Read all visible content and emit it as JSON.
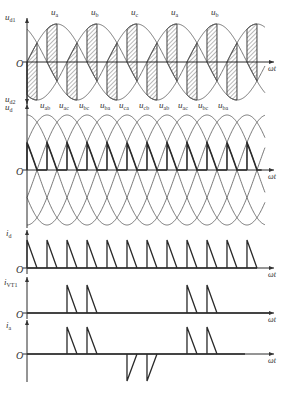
{
  "figure": {
    "origin_x": 27,
    "px_per_degree": 0.3333,
    "end_x": 265,
    "axis_end_x": 274,
    "ink_color": "#2a2a2a",
    "curve_color": "#555555"
  },
  "panels": {
    "phase": {
      "zero_y": 62,
      "amplitude_px": 38,
      "y_axis_top": 18,
      "y_axis_bottom": 104,
      "ylabel_top": "u",
      "ylabel_top_sub": "d1",
      "ylabel_bottom": "u",
      "ylabel_bottom_sub": "d2",
      "origin_label": "O",
      "xlabel": "ωt",
      "phase_labels": [
        {
          "base": "u",
          "sub": "a",
          "x": 51
        },
        {
          "base": "u",
          "sub": "b",
          "x": 91
        },
        {
          "base": "u",
          "sub": "c",
          "x": 131
        },
        {
          "base": "u",
          "sub": "a",
          "x": 171
        },
        {
          "base": "u",
          "sub": "b",
          "x": 211
        }
      ],
      "firing_deg_top": [
        0,
        120,
        240,
        360,
        480,
        600
      ],
      "firing_deg_bottom": [
        60,
        180,
        300,
        420,
        540,
        660
      ]
    },
    "line": {
      "zero_y": 170,
      "amplitude_px": 55,
      "y_axis_top": 104,
      "ylabel": "u",
      "ylabel_sub": "d",
      "origin_label": "O",
      "xlabel": "ωt",
      "line_labels": [
        {
          "base": "u",
          "sub": "ab",
          "x": 40
        },
        {
          "base": "u",
          "sub": "ac",
          "x": 59
        },
        {
          "base": "u",
          "sub": "bc",
          "x": 79
        },
        {
          "base": "u",
          "sub": "ba",
          "x": 100
        },
        {
          "base": "u",
          "sub": "ca",
          "x": 119
        },
        {
          "base": "u",
          "sub": "cb",
          "x": 139
        },
        {
          "base": "u",
          "sub": "ab",
          "x": 159
        },
        {
          "base": "u",
          "sub": "ac",
          "x": 178
        },
        {
          "base": "u",
          "sub": "bc",
          "x": 198
        },
        {
          "base": "u",
          "sub": "ba",
          "x": 218
        }
      ],
      "pulse_count": 12
    },
    "id": {
      "zero_y": 268,
      "peak_y": 240,
      "y_axis_top": 230,
      "ylabel": "i",
      "ylabel_sub": "d",
      "origin_label": "O",
      "xlabel": "ωt",
      "pulse_count": 12
    },
    "ivt1": {
      "zero_y": 313,
      "peak_y": 285,
      "y_axis_top": 277,
      "ylabel": "i",
      "ylabel_sub": "VT1",
      "origin_label": "O",
      "xlabel": "ωt",
      "pulse_deg": [
        120,
        180,
        480,
        540
      ]
    },
    "ia": {
      "zero_y": 354,
      "peak_y": 327,
      "trough_y": 381,
      "y_axis_top": 320,
      "y_axis_bottom": 382,
      "ylabel": "i",
      "ylabel_sub": "a",
      "origin_label": "O",
      "xlabel": "ωt",
      "pos_pulse_deg": [
        120,
        180,
        480,
        540
      ],
      "neg_pulse_deg": [
        300,
        360
      ],
      "trace_end_x": 245
    }
  }
}
